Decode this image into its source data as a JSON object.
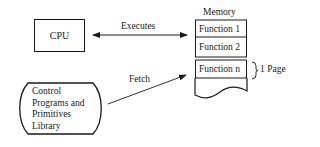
{
  "diagram": {
    "cpu": {
      "label": "CPU"
    },
    "executes": {
      "label": "Executes"
    },
    "fetch": {
      "label": "Fetch"
    },
    "memory": {
      "title": "Memory",
      "rows": [
        {
          "label": "Function 1"
        },
        {
          "label": "Function 2"
        },
        {
          "label": "Function n"
        }
      ],
      "page_bracket_label": "1 Page"
    },
    "library": {
      "lines": [
        "Control",
        "Programs and",
        "Primitives",
        "Library"
      ]
    }
  }
}
